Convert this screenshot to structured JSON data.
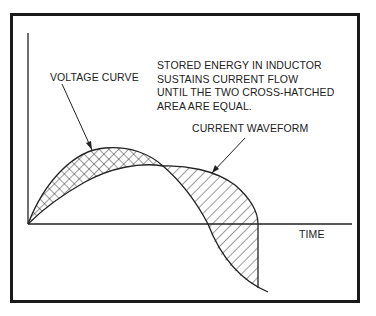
{
  "diagram": {
    "annotation_lines": [
      "STORED ENERGY IN INDUCTOR",
      "SUSTAINS CURRENT FLOW",
      "UNTIL THE TWO CROSS-HATCHED",
      "AREA ARE EQUAL."
    ],
    "voltage_label": "VOLTAGE CURVE",
    "current_label": "CURRENT WAVEFORM",
    "x_axis_label": "TIME"
  }
}
